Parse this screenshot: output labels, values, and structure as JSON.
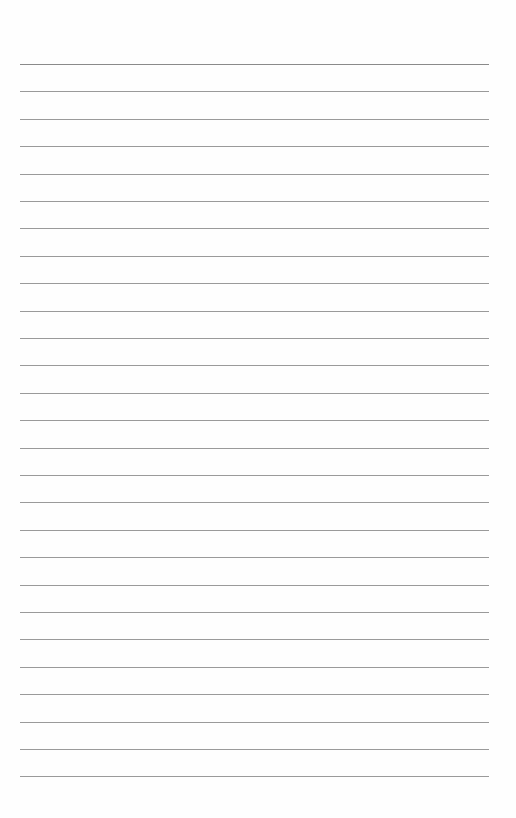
{
  "page": {
    "type": "lined-paper",
    "line_count": 27,
    "first_line_y": 64,
    "line_spacing": 27.4,
    "line_left": 20,
    "line_right": 489,
    "line_color": "#9a9a9a",
    "background_color": "#fefefe"
  }
}
